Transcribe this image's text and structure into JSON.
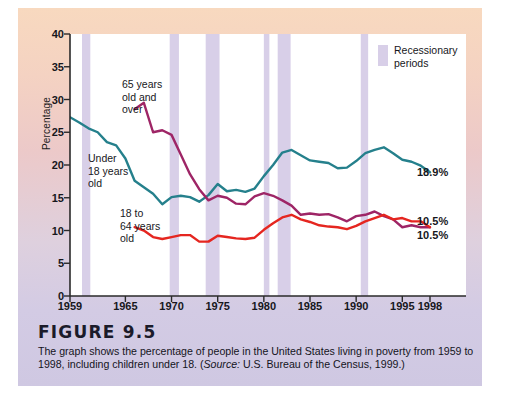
{
  "figure": {
    "heading": "FIGURE 9.5",
    "caption_line1": "The graph shows the percentage of people in the United States living in poverty from",
    "caption_line2_a": "1959 to 1998, including children under 18. (",
    "caption_source_word": "Source:",
    "caption_line2_b": " U.S. Bureau of the Census, 1999.)"
  },
  "legend": {
    "label_line1": "Recessionary",
    "label_line2": "periods",
    "swatch_color": "#d8cfe8"
  },
  "series_labels": {
    "over65_line1": "65 years",
    "over65_line2": "old and",
    "over65_line3": "over",
    "under18_line1": "Under",
    "under18_line2": "18 years",
    "under18_line3": "old",
    "adult_line1": "18 to",
    "adult_line2": "64 years",
    "adult_line3": "old"
  },
  "end_labels": {
    "under18": "18.9%",
    "over65": "10.5%",
    "adult": "10.5%"
  },
  "colors": {
    "under18": "#25808c",
    "over65": "#9e2566",
    "adult": "#e52620",
    "recession_band": "#d8cfe8",
    "axis": "#2a2a2a",
    "plot_background": "#ffffff",
    "panel_top": "#f8d9bf",
    "panel_bottom": "#cfc8e2"
  },
  "chart_data": {
    "type": "line",
    "title": "",
    "xlabel": "",
    "ylabel": "Percentage",
    "xlim": [
      1959,
      1998
    ],
    "ylim": [
      0,
      40
    ],
    "yticks": [
      0,
      5,
      10,
      15,
      20,
      25,
      30,
      35,
      40
    ],
    "xticks": [
      1959,
      1965,
      1970,
      1975,
      1980,
      1985,
      1990,
      1995,
      1998
    ],
    "grid": false,
    "legend_position": "top-right",
    "annotations": [
      "65 years old and over",
      "Under 18 years old",
      "18 to 64 years old",
      "Recessionary periods"
    ],
    "recession_bands": [
      [
        1960.3,
        1961.2
      ],
      [
        1969.8,
        1970.8
      ],
      [
        1973.7,
        1975.2
      ],
      [
        1980.0,
        1980.6
      ],
      [
        1981.5,
        1982.9
      ],
      [
        1990.5,
        1991.3
      ]
    ],
    "series": [
      {
        "name": "Under 18 years old",
        "color": "#25808c",
        "end_label": "18.9%",
        "x": [
          1959,
          1960,
          1961,
          1962,
          1963,
          1964,
          1965,
          1966,
          1967,
          1968,
          1969,
          1970,
          1971,
          1972,
          1973,
          1974,
          1975,
          1976,
          1977,
          1978,
          1979,
          1980,
          1981,
          1982,
          1983,
          1984,
          1985,
          1986,
          1987,
          1988,
          1989,
          1990,
          1991,
          1992,
          1993,
          1994,
          1995,
          1996,
          1997,
          1998
        ],
        "values": [
          27.3,
          26.5,
          25.6,
          25.0,
          23.5,
          23.0,
          21.0,
          17.6,
          16.6,
          15.6,
          14.0,
          15.1,
          15.3,
          15.1,
          14.4,
          15.4,
          17.1,
          16.0,
          16.2,
          15.9,
          16.4,
          18.3,
          20.0,
          21.9,
          22.3,
          21.5,
          20.7,
          20.5,
          20.3,
          19.5,
          19.6,
          20.6,
          21.8,
          22.3,
          22.7,
          21.8,
          20.8,
          20.5,
          19.9,
          18.9
        ]
      },
      {
        "name": "65 years and over",
        "color": "#9e2566",
        "end_label": "10.5%",
        "x": [
          1966,
          1967,
          1968,
          1969,
          1970,
          1971,
          1972,
          1973,
          1974,
          1975,
          1976,
          1977,
          1978,
          1979,
          1980,
          1981,
          1982,
          1983,
          1984,
          1985,
          1986,
          1987,
          1988,
          1989,
          1990,
          1991,
          1992,
          1993,
          1994,
          1995,
          1996,
          1997,
          1998
        ],
        "values": [
          28.5,
          29.5,
          25.0,
          25.3,
          24.6,
          21.6,
          18.6,
          16.3,
          14.6,
          15.3,
          15.0,
          14.1,
          14.0,
          15.2,
          15.7,
          15.3,
          14.6,
          13.8,
          12.4,
          12.6,
          12.4,
          12.5,
          12.0,
          11.4,
          12.2,
          12.4,
          12.9,
          12.2,
          11.7,
          10.5,
          10.8,
          10.5,
          10.5
        ]
      },
      {
        "name": "18 to 64 years old",
        "color": "#e52620",
        "end_label": "10.5%",
        "x": [
          1966,
          1967,
          1968,
          1969,
          1970,
          1971,
          1972,
          1973,
          1974,
          1975,
          1976,
          1977,
          1978,
          1979,
          1980,
          1981,
          1982,
          1983,
          1984,
          1985,
          1986,
          1987,
          1988,
          1989,
          1990,
          1991,
          1992,
          1993,
          1994,
          1995,
          1996,
          1997,
          1998
        ],
        "values": [
          10.5,
          10.0,
          9.0,
          8.7,
          9.0,
          9.3,
          9.3,
          8.3,
          8.3,
          9.2,
          9.0,
          8.8,
          8.7,
          8.9,
          10.1,
          11.1,
          12.0,
          12.4,
          11.7,
          11.3,
          10.8,
          10.6,
          10.5,
          10.2,
          10.7,
          11.4,
          11.9,
          12.4,
          11.7,
          11.9,
          11.4,
          11.4,
          10.5
        ]
      }
    ]
  }
}
